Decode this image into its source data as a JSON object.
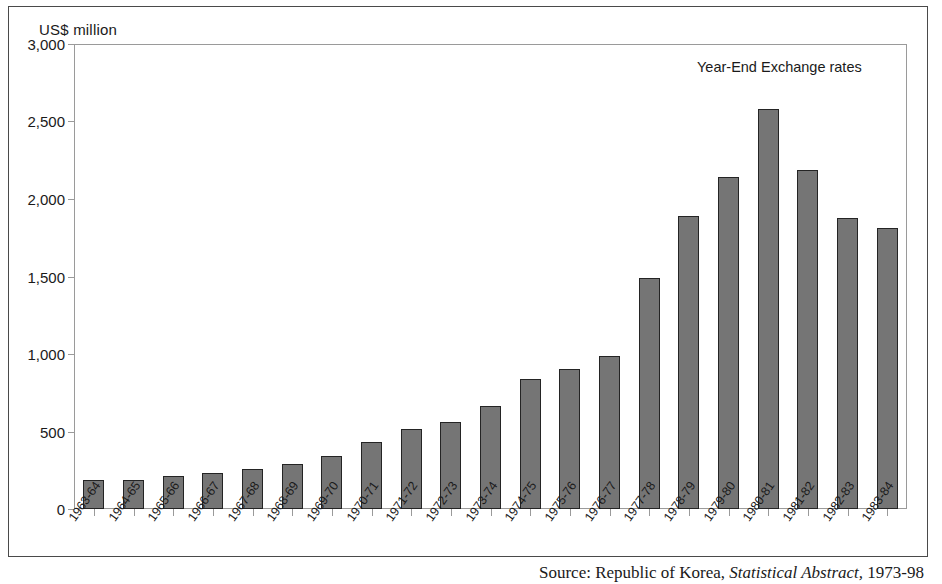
{
  "figure": {
    "axis_unit_label": "US$ million",
    "annotation": "Year-End Exchange rates",
    "source_prefix": "Source:",
    "source_body": "Republic of Korea,",
    "source_italic": "Statistical Abstract,",
    "source_suffix": "1973-98"
  },
  "chart_data": {
    "type": "bar",
    "title": "Year-End Exchange rates",
    "xlabel": "",
    "ylabel": "US$ million",
    "ylim": [
      0,
      3000
    ],
    "yticks": [
      0,
      500,
      1000,
      1500,
      2000,
      2500,
      3000
    ],
    "ytick_labels": [
      "0",
      "500",
      "1,000",
      "1,500",
      "2,000",
      "2,500",
      "3,000"
    ],
    "grid": false,
    "legend": "none",
    "bar_color": "#757575",
    "bar_edge_color": "#242424",
    "categories": [
      "1963-64",
      "1964-65",
      "1965-66",
      "1966-67",
      "1967-68",
      "1968-69",
      "1969-70",
      "1970-71",
      "1971-72",
      "1972-73",
      "1973-74",
      "1974-75",
      "1975-76",
      "1976-77",
      "1977-78",
      "1978-79",
      "1979-80",
      "1980-81",
      "1981-82",
      "1982-83",
      "1983-84"
    ],
    "values": [
      185,
      190,
      210,
      230,
      255,
      290,
      340,
      435,
      515,
      560,
      665,
      840,
      905,
      990,
      1490,
      1890,
      2140,
      2580,
      2190,
      1880,
      1810
    ]
  }
}
